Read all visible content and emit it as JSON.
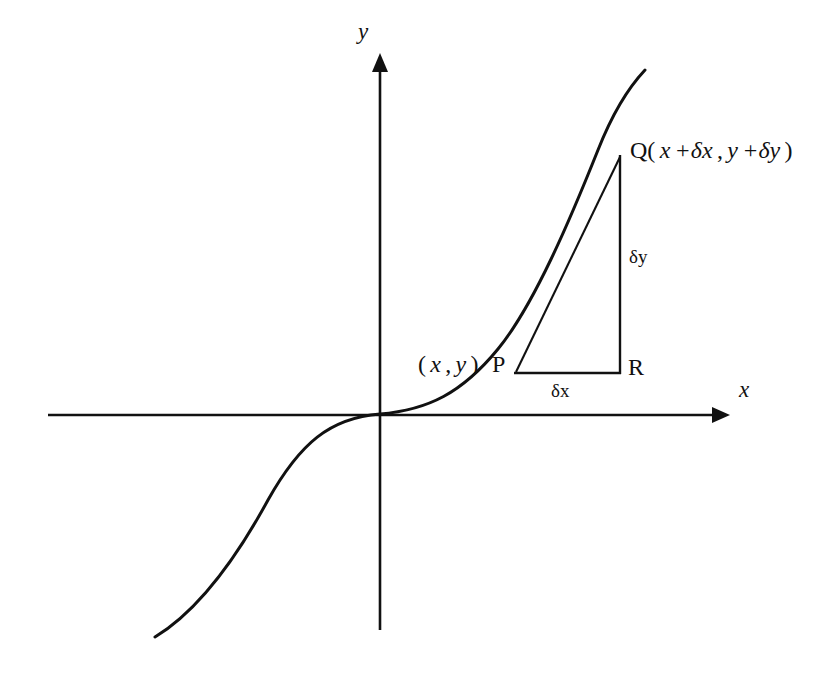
{
  "figure": {
    "background_color": "#ffffff",
    "ink_color": "#111111",
    "axes": {
      "x_label": "x",
      "y_label": "y",
      "x_axis_from": [
        48,
        415
      ],
      "x_axis_to": [
        725,
        415
      ],
      "y_axis_from": [
        380,
        630
      ],
      "y_axis_to": [
        380,
        55
      ],
      "origin": [
        380,
        414
      ],
      "arrowheads": [
        "x-positive",
        "y-positive"
      ]
    },
    "curve": {
      "shape": "cubic",
      "equation": "y = x^3",
      "from": [
        155,
        637
      ],
      "to": [
        645,
        70
      ],
      "passes_through_origin": true,
      "inflection_at_origin": true
    },
    "points": {
      "P": {
        "label": "P",
        "coord_label": "( x , y )",
        "at": [
          516,
          372
        ]
      },
      "Q": {
        "label": "Q",
        "coord_label": "Q( x +δx , y +δy )",
        "at": [
          620,
          157
        ]
      },
      "R": {
        "label": "R",
        "at": [
          620,
          372
        ]
      }
    },
    "segments": {
      "chord_PQ": {
        "from": [
          516,
          372
        ],
        "to": [
          620,
          157
        ],
        "style": "straight"
      },
      "horizontal_PR": {
        "from": [
          516,
          373
        ],
        "to": [
          620,
          373
        ],
        "label": "δx"
      },
      "vertical_QR": {
        "from": [
          620,
          157
        ],
        "to": [
          620,
          373
        ],
        "label": "δy"
      }
    },
    "labels": {
      "y_axis": "y",
      "x_axis": "x",
      "p_coord_open": "(",
      "p_coord_x": "x",
      "p_coord_comma": ",",
      "p_coord_y": "y",
      "p_coord_close": ")",
      "p_point": "P",
      "r_point": "R",
      "delta_x": "δx",
      "delta_y": "δy",
      "q_prefix": "Q(",
      "q_x": "x",
      "q_plus_dx": "+δx",
      "q_comma": ",",
      "q_y": "y",
      "q_plus_dy": "+δy",
      "q_close": ")"
    }
  }
}
